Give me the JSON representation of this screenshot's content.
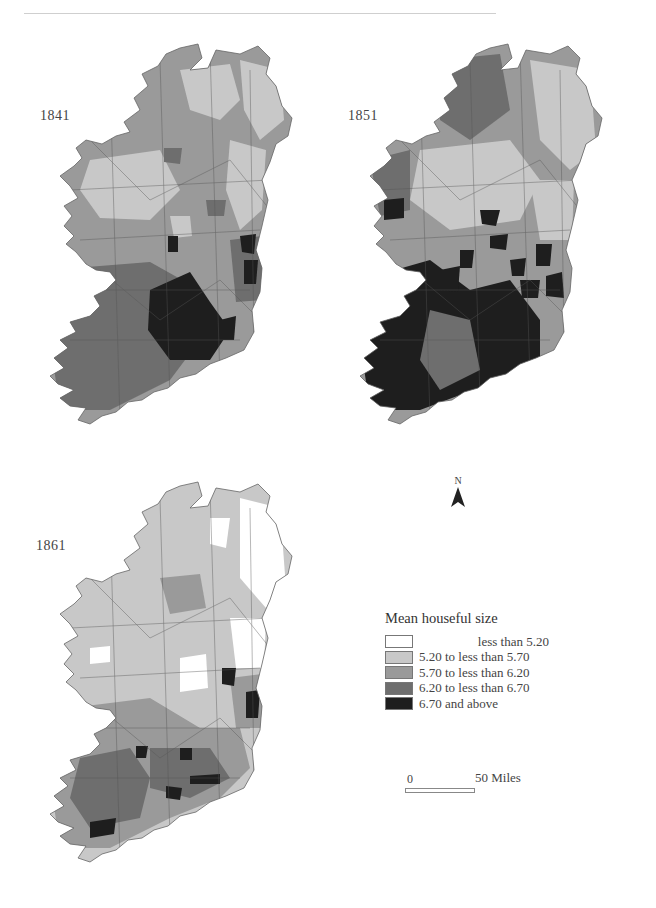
{
  "figure": {
    "maps": [
      {
        "year_label": "1841"
      },
      {
        "year_label": "1851"
      },
      {
        "year_label": "1861"
      }
    ],
    "legend": {
      "title": "Mean houseful size",
      "items": [
        {
          "label": "less than 5.20",
          "color": "#ffffff"
        },
        {
          "label": "5.20 to less than 5.70",
          "color": "#c8c8c8"
        },
        {
          "label": "5.70 to less than 6.20",
          "color": "#9a9a9a"
        },
        {
          "label": "6.20 to less than 6.70",
          "color": "#6e6e6e"
        },
        {
          "label": "6.70 and above",
          "color": "#1e1e1e"
        }
      ]
    },
    "north_arrow": {
      "label": "N"
    },
    "scale_bar": {
      "start_label": "0",
      "end_label": "50 Miles"
    }
  }
}
